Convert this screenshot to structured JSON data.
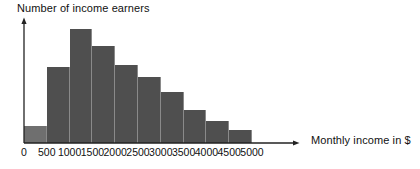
{
  "chart_data": {
    "type": "bar",
    "title": "",
    "xlabel": "Monthly income in $",
    "ylabel": "Number of income earners",
    "categories": [
      "0-500",
      "500-1000",
      "1000-1500",
      "1500-2000",
      "2000-2500",
      "2500-3000",
      "3000-3500",
      "3500-4000",
      "4000-4500",
      "4500-5000"
    ],
    "bin_edges": [
      0,
      500,
      1000,
      1500,
      2000,
      2500,
      3000,
      3500,
      4000,
      4500,
      5000
    ],
    "values": [
      17,
      76,
      114,
      97,
      78,
      66,
      51,
      33,
      22,
      13
    ],
    "xtick_labels": [
      "0",
      "500",
      "1000",
      "1500",
      "2000",
      "2500",
      "3000",
      "3500",
      "4000",
      "4500",
      "5000"
    ],
    "xlim": [
      0,
      5000
    ],
    "ylim": [
      0,
      120
    ],
    "ytick_labels": [],
    "grid": false,
    "legend": false,
    "bar_color": "#4f4f4f",
    "first_bar_color": "#6f6f6f",
    "axis_color": "#222222",
    "background": "#ffffff",
    "axis_arrows": {
      "y": "up-arrow",
      "x": "right-arrow"
    }
  }
}
